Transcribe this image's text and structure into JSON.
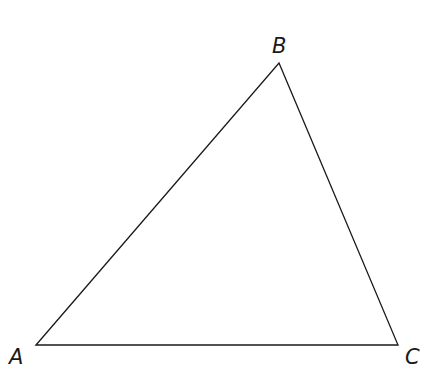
{
  "diagram": {
    "type": "triangle",
    "stroke_color": "#1a1a1a",
    "background": "#ffffff",
    "vertices": {
      "A": {
        "label": "A",
        "x": 36,
        "y": 345
      },
      "B": {
        "label": "B",
        "x": 279,
        "y": 63
      },
      "C": {
        "label": "C",
        "x": 398,
        "y": 345
      }
    },
    "labels": {
      "A": "A",
      "B": "B",
      "C": "C"
    }
  }
}
